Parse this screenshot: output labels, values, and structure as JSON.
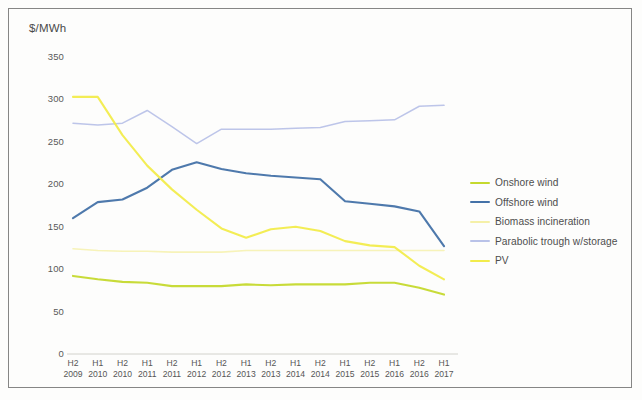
{
  "chart_data": {
    "type": "line",
    "title": "",
    "ylabel": "$/MWh",
    "xlabel": "",
    "ylim": [
      0,
      350
    ],
    "ytick_labels": [
      "0",
      "50",
      "100",
      "150",
      "200",
      "250",
      "300",
      "350"
    ],
    "yticks": [
      0,
      50,
      100,
      150,
      200,
      250,
      300,
      350
    ],
    "grid": false,
    "legend_position": "right",
    "categories": [
      "H2 2009",
      "H1 2010",
      "H2 2010",
      "H1 2011",
      "H2 2011",
      "H1 2012",
      "H2 2012",
      "H1 2013",
      "H2 2013",
      "H1 2014",
      "H2 2014",
      "H1 2015",
      "H2 2015",
      "H1 2016",
      "H2 2016",
      "H1 2017"
    ],
    "x_half_labels": [
      "H2",
      "H1",
      "H2",
      "H1",
      "H2",
      "H1",
      "H2",
      "H1",
      "H2",
      "H1",
      "H2",
      "H1",
      "H2",
      "H1",
      "H2",
      "H1"
    ],
    "x_year_labels": [
      "2009",
      "2010",
      "2010",
      "2011",
      "2011",
      "2012",
      "2012",
      "2013",
      "2013",
      "2014",
      "2014",
      "2015",
      "2015",
      "2016",
      "2016",
      "2017"
    ],
    "series": [
      {
        "name": "Onshore wind",
        "color": "#c5d92e",
        "values": [
          92,
          88,
          85,
          84,
          80,
          80,
          80,
          82,
          81,
          82,
          82,
          82,
          84,
          84,
          78,
          70
        ]
      },
      {
        "name": "Offshore wind",
        "color": "#4472a8",
        "values": [
          160,
          179,
          182,
          196,
          217,
          226,
          218,
          213,
          210,
          208,
          206,
          180,
          177,
          174,
          168,
          127
        ]
      },
      {
        "name": "Biomass incineration",
        "color": "#f5f0a8",
        "values": [
          124,
          122,
          121,
          121,
          120,
          120,
          120,
          122,
          122,
          122,
          122,
          122,
          122,
          122,
          122,
          122
        ]
      },
      {
        "name": "Parabolic trough w/storage",
        "color": "#b9c2e8",
        "values": [
          272,
          270,
          272,
          287,
          268,
          248,
          265,
          265,
          265,
          266,
          267,
          274,
          275,
          276,
          292,
          293
        ]
      },
      {
        "name": "PV",
        "color": "#f2ec4c",
        "values": [
          303,
          303,
          258,
          222,
          194,
          170,
          148,
          137,
          147,
          150,
          145,
          133,
          128,
          126,
          104,
          88
        ]
      }
    ]
  },
  "legend": {
    "items": [
      {
        "label": "Onshore wind",
        "color": "#c5d92e"
      },
      {
        "label": "Offshore wind",
        "color": "#4472a8"
      },
      {
        "label": "Biomass incineration",
        "color": "#f5f0a8"
      },
      {
        "label": "Parabolic trough w/storage",
        "color": "#b9c2e8"
      },
      {
        "label": "PV",
        "color": "#f2ec4c"
      }
    ]
  }
}
